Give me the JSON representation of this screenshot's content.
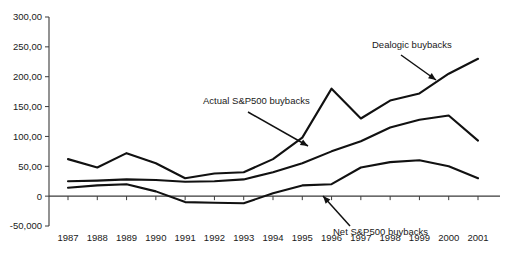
{
  "chart_data": {
    "type": "line",
    "title": "",
    "subtitle": "",
    "xlabel": "",
    "ylabel": "",
    "categories": [
      "1987",
      "1988",
      "1989",
      "1990",
      "1991",
      "1992",
      "1993",
      "1994",
      "1995",
      "1996",
      "1997",
      "1998",
      "1999",
      "2000",
      "2001"
    ],
    "x": [
      1987,
      1988,
      1989,
      1990,
      1991,
      1992,
      1993,
      1994,
      1995,
      1996,
      1997,
      1998,
      1999,
      2000,
      2001
    ],
    "ylim": [
      -50,
      300
    ],
    "xlim": [
      1987,
      2001
    ],
    "ytick_labels": [
      "300,00",
      "250,00",
      "200,00",
      "150,00",
      "100,00",
      "50,00",
      "0",
      "-50,000"
    ],
    "ytick_values": [
      300,
      250,
      200,
      150,
      100,
      50,
      0,
      -50
    ],
    "grid": false,
    "legend_position": "none",
    "series": [
      {
        "name": "Dealogic buybacks",
        "values": [
          62,
          48,
          72,
          55,
          30,
          38,
          40,
          62,
          98,
          180,
          130,
          160,
          172,
          205,
          230
        ]
      },
      {
        "name": "Actual S&P500 buybacks",
        "values": [
          25,
          26,
          28,
          27,
          24,
          25,
          28,
          40,
          55,
          75,
          92,
          115,
          128,
          135,
          93
        ]
      },
      {
        "name": "Net S&P500 buybacks",
        "values": [
          14,
          18,
          20,
          8,
          -10,
          -11,
          -12,
          5,
          18,
          20,
          48,
          57,
          60,
          50,
          30
        ]
      }
    ],
    "annotations": [
      {
        "text": "Dealogic buybacks",
        "text_x": 372,
        "text_y": 48,
        "arrow": {
          "x1": 401,
          "y1": 55,
          "x2": 436,
          "y2": 80
        }
      },
      {
        "text": "Actual S&P500 buybacks",
        "text_x": 203,
        "text_y": 104,
        "arrow": {
          "x1": 248,
          "y1": 112,
          "x2": 308,
          "y2": 146
        }
      },
      {
        "text": "Net S&P500 buybacks",
        "text_x": 333,
        "text_y": 235,
        "arrow": {
          "x1": 350,
          "y1": 226,
          "x2": 323,
          "y2": 196
        }
      }
    ]
  },
  "axis": {
    "y_labels": [
      "300,00",
      "250,00",
      "200,00",
      "150,00",
      "100,00",
      "50,00",
      "0",
      "-50,000"
    ],
    "x_labels": [
      "1987",
      "1988",
      "1989",
      "1990",
      "1991",
      "1992",
      "1993",
      "1994",
      "1995",
      "1996",
      "1997",
      "1998",
      "1999",
      "2000",
      "2001"
    ]
  }
}
